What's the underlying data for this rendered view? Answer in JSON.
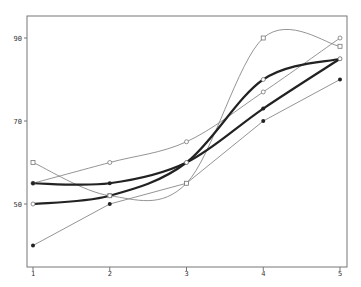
{
  "chart_data": {
    "type": "line",
    "title": "",
    "xlabel": "",
    "ylabel": "",
    "x": [
      1,
      2,
      3,
      4,
      5
    ],
    "xticks": [
      "1",
      "2",
      "3",
      "4",
      "5"
    ],
    "yticks": [
      "50",
      "70",
      "90"
    ],
    "ylim": [
      35,
      96
    ],
    "grid": false,
    "legend": null,
    "series": [
      {
        "name": "thin-filled",
        "style": "thin",
        "marker": "filled",
        "values": [
          40,
          50,
          55,
          70,
          80
        ]
      },
      {
        "name": "thin-open-circle",
        "style": "thin",
        "marker": "open",
        "values": [
          55,
          60,
          65,
          77,
          90
        ]
      },
      {
        "name": "thin-open-square",
        "style": "thin",
        "marker": "open-square",
        "values": [
          60,
          52,
          55,
          90,
          88
        ]
      },
      {
        "name": "thick-filled",
        "style": "thick",
        "marker": "filled",
        "values": [
          55,
          55,
          60,
          73,
          85
        ]
      },
      {
        "name": "thick-open",
        "style": "thick",
        "marker": "open",
        "values": [
          50,
          52,
          60,
          80,
          85
        ]
      }
    ]
  },
  "colors": {
    "axis": "#777777",
    "thin": "#888888",
    "thick": "#222222"
  }
}
